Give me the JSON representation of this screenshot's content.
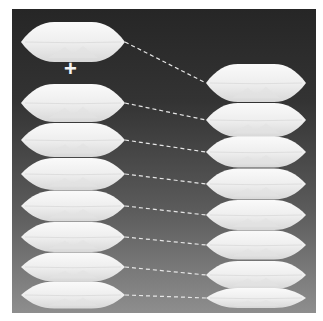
{
  "figure": {
    "operator_symbol": "+",
    "colors": {
      "background_top": "#262626",
      "background_bottom": "#8e8e8e",
      "pillow_fill": "#f2f2f2",
      "pillow_shade": "#d9d9d9",
      "connector": "#e6e6e6"
    },
    "left_column": {
      "top_pillow": {
        "cx": 73,
        "cy": 42,
        "w": 104,
        "h": 40
      },
      "stack": [
        {
          "cx": 73,
          "cy": 103,
          "w": 104,
          "h": 38
        },
        {
          "cx": 73,
          "cy": 140,
          "w": 104,
          "h": 34
        },
        {
          "cx": 73,
          "cy": 174,
          "w": 104,
          "h": 32
        },
        {
          "cx": 73,
          "cy": 206,
          "w": 104,
          "h": 31
        },
        {
          "cx": 73,
          "cy": 237,
          "w": 104,
          "h": 30
        },
        {
          "cx": 73,
          "cy": 267,
          "w": 104,
          "h": 29
        },
        {
          "cx": 73,
          "cy": 295,
          "w": 104,
          "h": 27
        }
      ]
    },
    "right_column": {
      "stack": [
        {
          "cx": 256,
          "cy": 83,
          "w": 100,
          "h": 38
        },
        {
          "cx": 256,
          "cy": 120,
          "w": 100,
          "h": 34
        },
        {
          "cx": 256,
          "cy": 152,
          "w": 100,
          "h": 31
        },
        {
          "cx": 256,
          "cy": 184,
          "w": 100,
          "h": 31
        },
        {
          "cx": 256,
          "cy": 215,
          "w": 100,
          "h": 30
        },
        {
          "cx": 256,
          "cy": 245,
          "w": 100,
          "h": 29
        },
        {
          "cx": 256,
          "cy": 275,
          "w": 100,
          "h": 28
        },
        {
          "cx": 256,
          "cy": 298,
          "w": 100,
          "h": 20
        }
      ]
    },
    "connectors": [
      {
        "x1": 125,
        "y1": 42,
        "x2": 206,
        "y2": 83
      },
      {
        "x1": 125,
        "y1": 103,
        "x2": 206,
        "y2": 120
      },
      {
        "x1": 125,
        "y1": 140,
        "x2": 206,
        "y2": 152
      },
      {
        "x1": 125,
        "y1": 174,
        "x2": 206,
        "y2": 184
      },
      {
        "x1": 125,
        "y1": 206,
        "x2": 206,
        "y2": 215
      },
      {
        "x1": 125,
        "y1": 237,
        "x2": 206,
        "y2": 245
      },
      {
        "x1": 125,
        "y1": 267,
        "x2": 206,
        "y2": 275
      },
      {
        "x1": 125,
        "y1": 295,
        "x2": 206,
        "y2": 298
      }
    ]
  }
}
